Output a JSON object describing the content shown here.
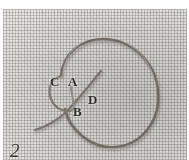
{
  "figure": {
    "number": "2",
    "caption_present": false,
    "medium": "halftone photographic scan"
  },
  "labels": [
    {
      "id": "label-c",
      "text": "C",
      "x": 47,
      "y": 66,
      "describes": "left bight of the loop"
    },
    {
      "id": "label-a",
      "text": "A",
      "x": 65,
      "y": 66,
      "describes": "upper crossing point of the thread"
    },
    {
      "id": "label-b",
      "text": "B",
      "x": 70,
      "y": 96,
      "describes": "lower crossing point of the thread"
    },
    {
      "id": "label-d",
      "text": "D",
      "x": 85,
      "y": 84,
      "describes": "interior of the large loop"
    }
  ],
  "colors": {
    "page_background": "#ffffff",
    "fabric_base": "#e9e7e3",
    "fabric_weave_dark": "#78746e",
    "thread_dark": "#6f6a64",
    "thread_mid": "#8d8880",
    "label_text": "#2d2b28",
    "figure_number_text": "#34322e"
  },
  "geometry": {
    "swatch": {
      "x": 3,
      "y": 9,
      "width": 184,
      "height": 151
    },
    "thread_paths": {
      "main_loop": "M 58 67 C 60 44, 78 30, 100 30 C 128 30, 152 52, 155 82 C 158 112, 138 136, 112 138 C 88 140, 66 120, 62 100",
      "crossing_tail": "M 98 62 C 88 74, 74 92, 62 104 C 52 113, 42 118, 32 121",
      "left_bight": "M 58 67 C 48 70, 44 80, 48 90 C 52 100, 62 104, 70 101"
    }
  }
}
